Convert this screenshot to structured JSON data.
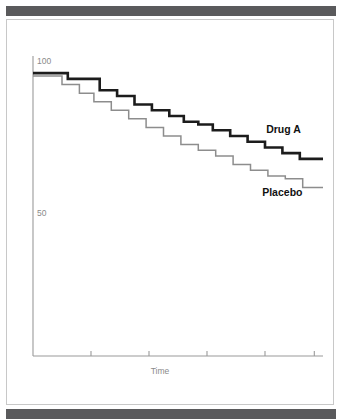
{
  "figure": {
    "top_rule_color": "#5a5a5c",
    "bottom_rule_color": "#5a5a5c",
    "card_border_color": "#c8c8c8",
    "background": "#ffffff"
  },
  "labels": {
    "y_100": "100",
    "y_50": "50",
    "x_title": "Time",
    "series_treatment": "Drug A",
    "series_control": "Placebo"
  },
  "chart_data": {
    "type": "line",
    "subtype": "kaplan-meier-step",
    "title": "",
    "xlabel": "Time",
    "ylabel": "",
    "grid": false,
    "legend": "inline-end-of-curve",
    "xlim": [
      0,
      100
    ],
    "ylim": [
      0,
      105
    ],
    "yticks": [
      50,
      100
    ],
    "ytick_labels": [
      "50",
      "100"
    ],
    "xticks": [
      20,
      40,
      60,
      80,
      97
    ],
    "xtick_labels": [
      "",
      "",
      "",
      "",
      ""
    ],
    "colors": {
      "Drug A": "#1c1c1c",
      "Placebo": "#8d8d8d",
      "axis": "#9a9a9a",
      "tick_text": "#8a8a8a"
    },
    "series": [
      {
        "name": "Drug A",
        "color": "#1c1c1c",
        "line_width": 2.6,
        "x": [
          0,
          12,
          12,
          23,
          23,
          29,
          29,
          35,
          35,
          41,
          41,
          47,
          47,
          52,
          52,
          57,
          57,
          62,
          62,
          68,
          68,
          74,
          74,
          80,
          80,
          86,
          86,
          92,
          92,
          100
        ],
        "y": [
          99,
          99,
          97,
          97,
          93,
          93,
          91,
          91,
          88,
          88,
          86,
          86,
          84,
          84,
          82,
          82,
          81,
          81,
          79,
          79,
          77,
          77,
          75,
          75,
          73,
          73,
          71,
          71,
          69,
          69
        ]
      },
      {
        "name": "Placebo",
        "color": "#8d8d8d",
        "line_width": 1.5,
        "x": [
          0,
          10,
          10,
          16,
          16,
          21,
          21,
          27,
          27,
          33,
          33,
          39,
          39,
          45,
          45,
          51,
          51,
          57,
          57,
          63,
          63,
          69,
          69,
          75,
          75,
          81,
          81,
          87,
          87,
          93,
          93,
          100
        ],
        "y": [
          98,
          98,
          95,
          95,
          92,
          92,
          89,
          89,
          86,
          86,
          83,
          83,
          80,
          80,
          77,
          77,
          74,
          74,
          72,
          72,
          70,
          70,
          67,
          67,
          65,
          65,
          63,
          63,
          62,
          62,
          59,
          59
        ]
      }
    ],
    "annotations": [
      {
        "text": "Drug A",
        "x": 88,
        "y": 78,
        "bold": true
      },
      {
        "text": "Placebo",
        "x": 88,
        "y": 56,
        "bold": true
      }
    ]
  }
}
